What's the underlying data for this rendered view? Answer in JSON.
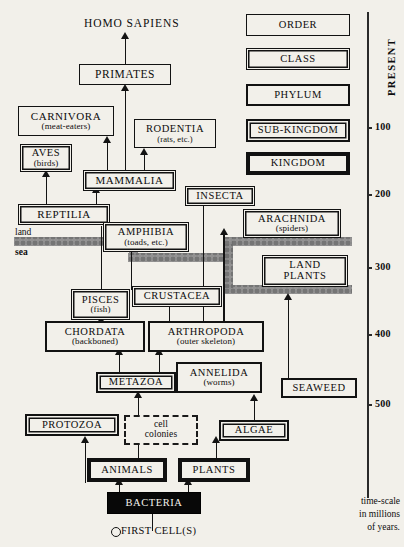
{
  "figure": {
    "type": "evolutionary-tree-diagram",
    "background_color": "#f2f0ea",
    "ink_color": "#121212",
    "sea_band_color": "#8e8e8e"
  },
  "top_label": {
    "text": "HOMO SAPIENS"
  },
  "environment_labels": {
    "land": "land",
    "sea": "sea"
  },
  "origin": {
    "label": "FIRST CELL(S)",
    "marker": "open-circle"
  },
  "legend": {
    "title": "taxonomic ranks",
    "items": [
      {
        "label": "ORDER",
        "rank": 1,
        "border_style": "thin-single"
      },
      {
        "label": "CLASS",
        "rank": 2,
        "border_style": "thin-double"
      },
      {
        "label": "PHYLUM",
        "rank": 3,
        "border_style": "medium-single"
      },
      {
        "label": "SUB-KINGDOM",
        "rank": 4,
        "border_style": "thick-double"
      },
      {
        "label": "KINGDOM",
        "rank": 5,
        "border_style": "very-thick-single"
      }
    ]
  },
  "axis": {
    "title": "PRESENT",
    "caption_lines": [
      "time-scale",
      "in millions",
      "of years."
    ],
    "unit": "millions of years",
    "ticks": [
      {
        "value": 100
      },
      {
        "value": 200
      },
      {
        "value": 300
      },
      {
        "value": 400
      },
      {
        "value": 500
      }
    ]
  },
  "taxa": {
    "primates": {
      "name": "PRIMATES",
      "sub": "",
      "rank": "ORDER"
    },
    "carnivora": {
      "name": "CARNIVORA",
      "sub": "(meat-eaters)",
      "rank": "ORDER"
    },
    "rodentia": {
      "name": "RODENTIA",
      "sub": "(rats, etc.)",
      "rank": "ORDER"
    },
    "aves": {
      "name": "AVES",
      "sub": "(birds)",
      "rank": "CLASS"
    },
    "mammalia": {
      "name": "MAMMALIA",
      "sub": "",
      "rank": "CLASS"
    },
    "reptilia": {
      "name": "REPTILIA",
      "sub": "",
      "rank": "CLASS"
    },
    "amphibia": {
      "name": "AMPHIBIA",
      "sub": "(toads, etc.)",
      "rank": "CLASS"
    },
    "insecta": {
      "name": "INSECTA",
      "sub": "",
      "rank": "CLASS"
    },
    "arachnida": {
      "name": "ARACHNIDA",
      "sub": "(spiders)",
      "rank": "CLASS"
    },
    "pisces": {
      "name": "PISCES",
      "sub": "(fish)",
      "rank": "CLASS"
    },
    "crustacea": {
      "name": "CRUSTACEA",
      "sub": "",
      "rank": "CLASS"
    },
    "land_plants": {
      "name": "LAND",
      "sub": "PLANTS",
      "rank": "CLASS"
    },
    "chordata": {
      "name": "CHORDATA",
      "sub": "(backboned)",
      "rank": "PHYLUM"
    },
    "arthropoda": {
      "name": "ARTHROPODA",
      "sub": "(outer skeleton)",
      "rank": "PHYLUM"
    },
    "annelida": {
      "name": "ANNELIDA",
      "sub": "(worms)",
      "rank": "PHYLUM"
    },
    "seaweed": {
      "name": "SEAWEED",
      "sub": "",
      "rank": "PHYLUM"
    },
    "metazoa": {
      "name": "METAZOA",
      "sub": "",
      "rank": "SUB-KINGDOM"
    },
    "protozoa": {
      "name": "PROTOZOA",
      "sub": "",
      "rank": "SUB-KINGDOM"
    },
    "algae": {
      "name": "ALGAE",
      "sub": "",
      "rank": "SUB-KINGDOM"
    },
    "animals": {
      "name": "ANIMALS",
      "sub": "",
      "rank": "KINGDOM"
    },
    "plants": {
      "name": "PLANTS",
      "sub": "",
      "rank": "KINGDOM"
    },
    "bacteria": {
      "name": "BACTERIA",
      "sub": "",
      "rank": "KINGDOM"
    },
    "cell_colonies": {
      "name": "cell",
      "sub": "colonies",
      "rank": "hypothetical"
    }
  }
}
